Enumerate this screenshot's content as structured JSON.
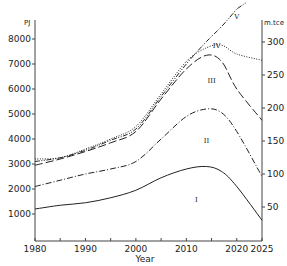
{
  "chart_data": {
    "type": "line",
    "title": "",
    "xlabel": "Year",
    "ylabel": "PJ",
    "ylabel_right": "m.tce",
    "xlim": [
      1980,
      2025
    ],
    "ylim": [
      0,
      8800
    ],
    "ylim_right": [
      0,
      330
    ],
    "grid": false,
    "legend": "inline roman numeral labels",
    "x_ticks": [
      1980,
      1990,
      2000,
      2010,
      2020,
      2025
    ],
    "x_tick_labels": [
      "1980",
      "1990",
      "2000",
      "2010",
      "2020",
      "2025"
    ],
    "y_ticks": [
      1000,
      2000,
      3000,
      4000,
      5000,
      6000,
      7000,
      8000
    ],
    "y_tick_labels": [
      "1000",
      "2000",
      "3000",
      "4000",
      "5000",
      "6000",
      "7000",
      "8000"
    ],
    "y_right_ticks": [
      50,
      100,
      150,
      200,
      250,
      300
    ],
    "y_right_tick_labels": [
      "50",
      "100",
      "150",
      "200",
      "250",
      "300"
    ],
    "x": [
      1980,
      1985,
      1990,
      1995,
      2000,
      2005,
      2010,
      2014,
      2017,
      2020,
      2025
    ],
    "series": [
      {
        "name": "I",
        "style": "solid",
        "values": [
          1200,
          1350,
          1450,
          1650,
          1950,
          2450,
          2800,
          2900,
          2700,
          2100,
          750
        ]
      },
      {
        "name": "II",
        "style": "dash-dot",
        "values": [
          2100,
          2350,
          2600,
          2800,
          3100,
          4000,
          4900,
          5200,
          5050,
          4300,
          2500
        ]
      },
      {
        "name": "III",
        "style": "long-dash",
        "values": [
          2950,
          3200,
          3500,
          3850,
          4300,
          5600,
          6800,
          7350,
          7100,
          6000,
          4750
        ]
      },
      {
        "name": "IV",
        "style": "dotted",
        "values": [
          3200,
          3250,
          3600,
          4000,
          4500,
          5800,
          7100,
          7650,
          7750,
          7400,
          7150
        ]
      },
      {
        "name": "V",
        "style": "dash-dot-dot",
        "values": [
          3100,
          3250,
          3550,
          3950,
          4400,
          5700,
          7000,
          7900,
          8500,
          9200,
          null
        ]
      }
    ],
    "annotations": [
      {
        "text": "I",
        "x": 2012,
        "y": 1500
      },
      {
        "text": "II",
        "x": 2014,
        "y": 3850
      },
      {
        "text": "III",
        "x": 2015,
        "y": 6250
      },
      {
        "text": "IV",
        "x": 2016,
        "y": 7650
      },
      {
        "text": "V",
        "x": 2020,
        "y": 8800
      }
    ]
  }
}
